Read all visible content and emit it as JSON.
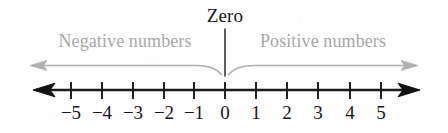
{
  "figure": {
    "title_label": "Zero",
    "left_region_label": "Negative numbers",
    "right_region_label": "Positive numbers"
  },
  "colors": {
    "axis": "#1a1a1a",
    "tick": "#1a1a1a",
    "number_text": "#16161a",
    "zero_text": "#171717",
    "region_text": "#a8a8a8",
    "region_arrow": "#b0b0b0",
    "background": "#fefefe"
  },
  "chart_data": {
    "type": "number-line",
    "title": "Zero",
    "xlabel": "",
    "ylabel": "",
    "xlim": [
      -5.6,
      5.6
    ],
    "grid": false,
    "legend_position": "above-axis",
    "tick_values": [
      -5,
      -4,
      -3,
      -2,
      -1,
      0,
      1,
      2,
      3,
      4,
      5
    ],
    "tick_labels": [
      "−5",
      "−4",
      "−3",
      "−2",
      "−1",
      "0",
      "1",
      "2",
      "3",
      "4",
      "5"
    ],
    "tick_x_px": [
      71,
      102,
      133,
      164,
      194,
      225,
      256,
      287,
      318,
      350,
      381
    ],
    "axis_y_px": 90,
    "axis_start_px": 33,
    "axis_end_px": 420,
    "arrowheads": [
      "left",
      "right"
    ],
    "annotations": [
      {
        "label": "Negative numbers",
        "range": [
          -5.6,
          0
        ],
        "color": "#a8a8a8",
        "arrow_direction": "left",
        "center_x_px": 125
      },
      {
        "label": "Positive numbers",
        "range": [
          0,
          5.6
        ],
        "color": "#a8a8a8",
        "arrow_direction": "right",
        "center_x_px": 325
      },
      {
        "label": "Zero",
        "value": 0,
        "color": "#171717",
        "pointer": "vertical-line",
        "center_x_px": 225
      }
    ]
  },
  "tick_items": [
    {
      "label": "−5",
      "x": 71
    },
    {
      "label": "−4",
      "x": 102
    },
    {
      "label": "−3",
      "x": 133
    },
    {
      "label": "−2",
      "x": 164
    },
    {
      "label": "−1",
      "x": 194
    },
    {
      "label": "0",
      "x": 225
    },
    {
      "label": "1",
      "x": 256
    },
    {
      "label": "2",
      "x": 287
    },
    {
      "label": "3",
      "x": 318
    },
    {
      "label": "4",
      "x": 350
    },
    {
      "label": "5",
      "x": 381
    }
  ]
}
